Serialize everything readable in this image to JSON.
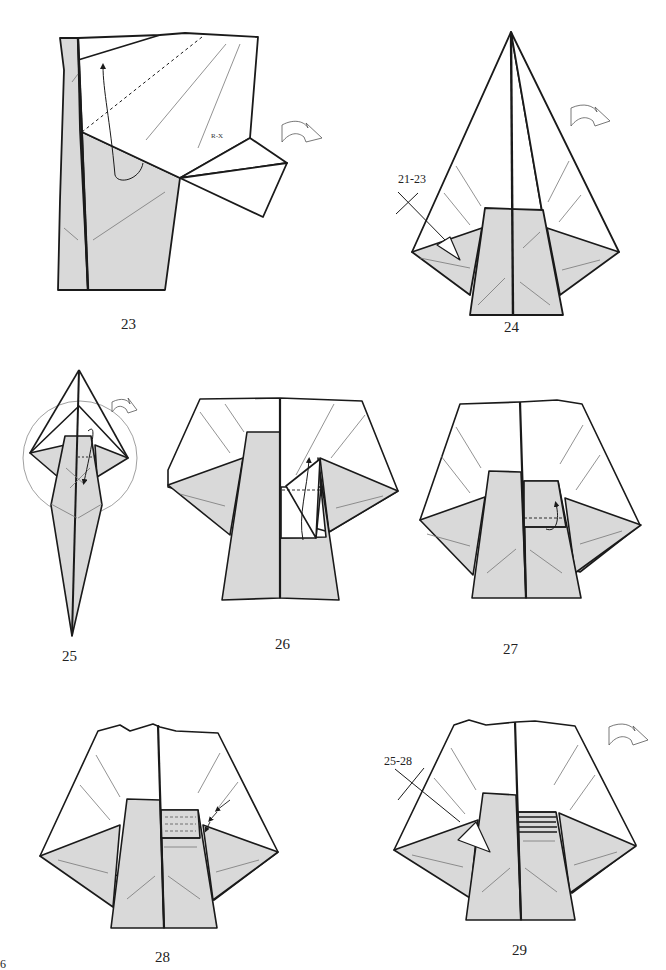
{
  "page": {
    "number": "6"
  },
  "colors": {
    "paper_back": "#d9d9d9",
    "paper_front": "#ffffff",
    "line": "#1a1a1a",
    "crease": "#777777"
  },
  "steps": [
    {
      "number": "23",
      "label": "R-X",
      "icons": [
        "valley-fold-arrow",
        "turn-over-arrow"
      ]
    },
    {
      "number": "24",
      "ref": "21-23",
      "icons": [
        "turn-over-arrow",
        "push-arrow",
        "repeat-x-mark"
      ]
    },
    {
      "number": "25",
      "icons": [
        "zoom-circle",
        "turn-over-arrow",
        "fold-down-arrow"
      ]
    },
    {
      "number": "26",
      "icons": [
        "fold-up-arrow",
        "valley-fold-line"
      ]
    },
    {
      "number": "27",
      "icons": [
        "fold-up-arrow",
        "valley-fold-line"
      ]
    },
    {
      "number": "28",
      "icons": [
        "pleat-arrows",
        "valley-fold-lines"
      ]
    },
    {
      "number": "29",
      "ref": "25-28",
      "icons": [
        "turn-over-arrow",
        "push-arrow",
        "repeat-x-mark"
      ]
    }
  ]
}
